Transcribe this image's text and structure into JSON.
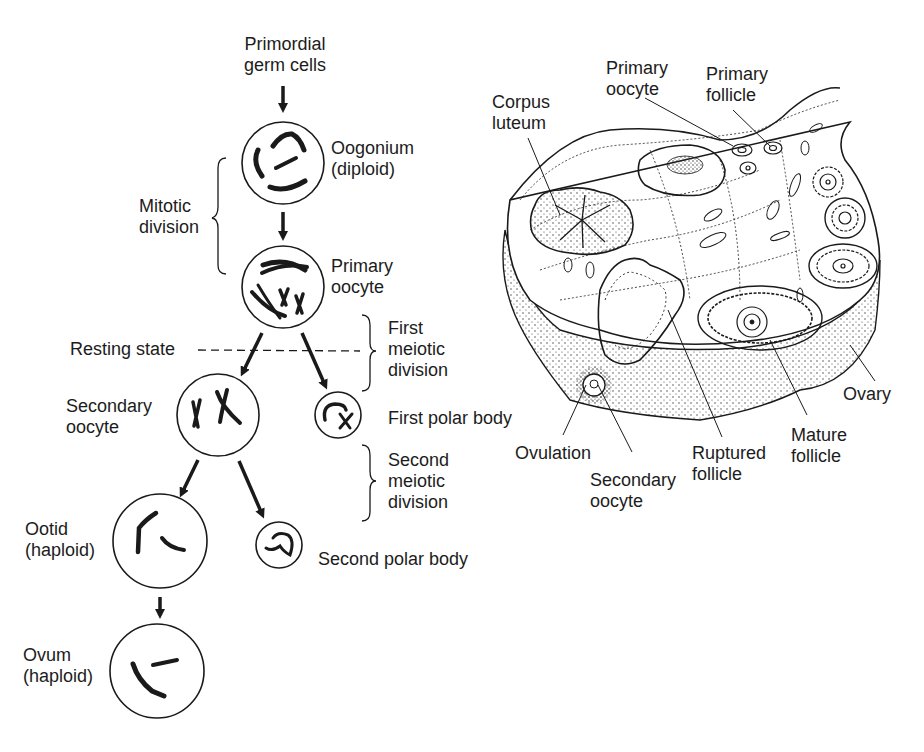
{
  "oogenesis": {
    "primordial": {
      "line1": "Primordial",
      "line2": "germ cells"
    },
    "oogonium": {
      "line1": "Oogonium",
      "line2": "(diploid)"
    },
    "mitotic": {
      "line1": "Mitotic",
      "line2": "division"
    },
    "primary_oocyte": {
      "line1": "Primary",
      "line2": "oocyte"
    },
    "resting_state": "Resting state",
    "first_meiotic": {
      "line1": "First",
      "line2": "meiotic",
      "line3": "division"
    },
    "secondary_oocyte": {
      "line1": "Secondary",
      "line2": "oocyte"
    },
    "first_polar_body": "First polar body",
    "second_meiotic": {
      "line1": "Second",
      "line2": "meiotic",
      "line3": "division"
    },
    "ootid": {
      "line1": "Ootid",
      "line2": "(haploid)"
    },
    "second_polar_body": "Second polar body",
    "ovum": {
      "line1": "Ovum",
      "line2": "(haploid)"
    }
  },
  "ovary": {
    "corpus_luteum": {
      "line1": "Corpus",
      "line2": "luteum"
    },
    "primary_oocyte": {
      "line1": "Primary",
      "line2": "oocyte"
    },
    "primary_follicle": {
      "line1": "Primary",
      "line2": "follicle"
    },
    "ovary": "Ovary",
    "mature_follicle": {
      "line1": "Mature",
      "line2": "follicle"
    },
    "ruptured_follicle": {
      "line1": "Ruptured",
      "line2": "follicle"
    },
    "ovulation": "Ovulation",
    "secondary_oocyte": {
      "line1": "Secondary",
      "line2": "oocyte"
    }
  },
  "colors": {
    "ink": "#1a1a1a",
    "background": "#ffffff"
  }
}
